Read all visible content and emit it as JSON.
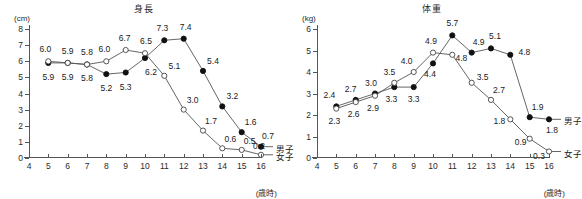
{
  "figure": {
    "panels": [
      {
        "id": "height",
        "title": "身長",
        "y_unit": "(cm)",
        "x_unit": "(歳時)",
        "legend": {
          "boys": "男子",
          "girls": "女子"
        }
      },
      {
        "id": "weight",
        "title": "体重",
        "y_unit": "(kg)",
        "x_unit": "(歳時)",
        "legend": {
          "boys": "男子",
          "girls": "女子"
        }
      }
    ]
  },
  "chart_data": [
    {
      "type": "line",
      "title": "身長",
      "xlabel": "(歳時)",
      "ylabel": "(cm)",
      "xlim": [
        4,
        16
      ],
      "ylim": [
        0,
        8
      ],
      "xticks": [
        4,
        5,
        6,
        7,
        8,
        9,
        10,
        11,
        12,
        13,
        14,
        15,
        16
      ],
      "yticks": [
        0,
        1,
        2,
        3,
        4,
        5,
        6,
        7,
        8
      ],
      "grid": false,
      "legend_position": "right-end-of-lines",
      "x": [
        5,
        6,
        7,
        8,
        9,
        10,
        11,
        12,
        13,
        14,
        15,
        16
      ],
      "series": [
        {
          "name": "男子",
          "marker": "filled-circle",
          "values": [
            5.9,
            5.9,
            5.8,
            5.2,
            5.3,
            6.2,
            7.3,
            7.4,
            5.4,
            3.2,
            1.6,
            0.7
          ],
          "labels": [
            "5.9",
            "5.9",
            "5.8",
            "5.2",
            "5.3",
            "6.2",
            "7.3",
            "7.4",
            "5.4",
            "3.2",
            "1.6",
            "0.7"
          ]
        },
        {
          "name": "女子",
          "marker": "open-circle",
          "values": [
            6.0,
            5.9,
            5.8,
            6.0,
            6.7,
            6.5,
            5.1,
            3.0,
            1.7,
            0.6,
            0.5,
            0.2
          ],
          "labels": [
            "6.0",
            "5.9",
            "5.8",
            "6.0",
            "6.7",
            "6.5",
            "5.1",
            "3.0",
            "1.7",
            "0.6",
            "0.5",
            "0.2"
          ]
        }
      ]
    },
    {
      "type": "line",
      "title": "体重",
      "xlabel": "(歳時)",
      "ylabel": "(kg)",
      "xlim": [
        4,
        16
      ],
      "ylim": [
        0,
        6
      ],
      "xticks": [
        4,
        5,
        6,
        7,
        8,
        9,
        10,
        11,
        12,
        13,
        14,
        15,
        16
      ],
      "yticks": [
        0,
        1,
        2,
        3,
        4,
        5,
        6
      ],
      "grid": false,
      "legend_position": "right-end-of-lines",
      "x": [
        5,
        6,
        7,
        8,
        9,
        10,
        11,
        12,
        13,
        14,
        15,
        16
      ],
      "series": [
        {
          "name": "男子",
          "marker": "filled-circle",
          "values": [
            2.4,
            2.7,
            3.0,
            3.3,
            3.3,
            4.4,
            5.7,
            4.9,
            5.1,
            4.8,
            1.9,
            1.8
          ],
          "labels": [
            "2.4",
            "2.7",
            "3.0",
            "3.3",
            "3.3",
            "4.4",
            "5.7",
            "4.9",
            "5.1",
            "4.8",
            "1.9",
            "1.8"
          ]
        },
        {
          "name": "女子",
          "marker": "open-circle",
          "values": [
            2.3,
            2.6,
            2.9,
            3.5,
            4.0,
            4.9,
            4.8,
            3.5,
            2.7,
            1.8,
            0.9,
            0.3
          ],
          "labels": [
            "2.3",
            "2.6",
            "2.9",
            "3.5",
            "4.0",
            "4.9",
            "4.8",
            "3.5",
            "2.7",
            "1.8",
            "0.9",
            "0.3"
          ]
        }
      ]
    }
  ],
  "label_offsets": [
    {
      "boys": [
        [
          0,
          14
        ],
        [
          0,
          14
        ],
        [
          0,
          14
        ],
        [
          0,
          14
        ],
        [
          0,
          14
        ],
        [
          6,
          14
        ],
        [
          -2,
          -12
        ],
        [
          2,
          -12
        ],
        [
          10,
          -10
        ],
        [
          10,
          -10
        ],
        [
          9,
          -10
        ],
        [
          7,
          -11
        ]
      ],
      "girls": [
        [
          -3,
          -12
        ],
        [
          0,
          -12
        ],
        [
          0,
          -12
        ],
        [
          -2,
          -12
        ],
        [
          -1,
          -12
        ],
        [
          1,
          -12
        ],
        [
          10,
          -10
        ],
        [
          9,
          -10
        ],
        [
          8,
          -10
        ],
        [
          8,
          -9
        ],
        [
          8,
          -9
        ],
        [
          -2,
          -9
        ]
      ]
    },
    {
      "boys": [
        [
          -7,
          -11
        ],
        [
          -5,
          -11
        ],
        [
          -4,
          -11
        ],
        [
          -3,
          12
        ],
        [
          0,
          12
        ],
        [
          -3,
          11
        ],
        [
          0,
          -12
        ],
        [
          7,
          -11
        ],
        [
          4,
          -12
        ],
        [
          14,
          -3
        ],
        [
          8,
          -10
        ],
        [
          3,
          11
        ]
      ],
      "girls": [
        [
          -2,
          12
        ],
        [
          -2,
          12
        ],
        [
          -2,
          12
        ],
        [
          -5,
          -11
        ],
        [
          -7,
          -11
        ],
        [
          -2,
          -12
        ],
        [
          9,
          3
        ],
        [
          11,
          -6
        ],
        [
          8,
          -10
        ],
        [
          -11,
          2
        ],
        [
          -9,
          3
        ],
        [
          -10,
          4
        ]
      ]
    }
  ]
}
